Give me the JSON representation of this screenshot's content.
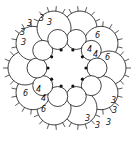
{
  "diagram": {
    "type": "tatting-medallion",
    "center": [
      67,
      68
    ],
    "inner_rings": {
      "count": 10,
      "orbit_radius": 30,
      "ring_radius": 10
    },
    "outer_chains": {
      "count": 10,
      "orbit_radius": 42,
      "chain_radius": 17,
      "picots_per_chain": 5
    },
    "join_dots": {
      "count": 10,
      "orbit_radius": 19
    },
    "labels": [
      {
        "text": "3",
        "x": 27,
        "y": 26
      },
      {
        "text": "3",
        "x": 39,
        "y": 21
      },
      {
        "text": "3",
        "x": 47,
        "y": 25
      },
      {
        "text": "3",
        "x": 20,
        "y": 35
      },
      {
        "text": "3",
        "x": 21,
        "y": 45
      },
      {
        "text": "6",
        "x": 95,
        "y": 38
      },
      {
        "text": "4",
        "x": 87,
        "y": 52
      },
      {
        "text": "4",
        "x": 93,
        "y": 57
      },
      {
        "text": "6",
        "x": 105,
        "y": 60
      },
      {
        "text": "6",
        "x": 23,
        "y": 96
      },
      {
        "text": "4",
        "x": 36,
        "y": 92
      },
      {
        "text": "4",
        "x": 41,
        "y": 101
      },
      {
        "text": "6",
        "x": 41,
        "y": 112
      },
      {
        "text": "3",
        "x": 111,
        "y": 103
      },
      {
        "text": "3",
        "x": 112,
        "y": 113
      },
      {
        "text": "3",
        "x": 106,
        "y": 125
      },
      {
        "text": "3",
        "x": 95,
        "y": 128
      },
      {
        "text": "3",
        "x": 85,
        "y": 121
      }
    ]
  }
}
